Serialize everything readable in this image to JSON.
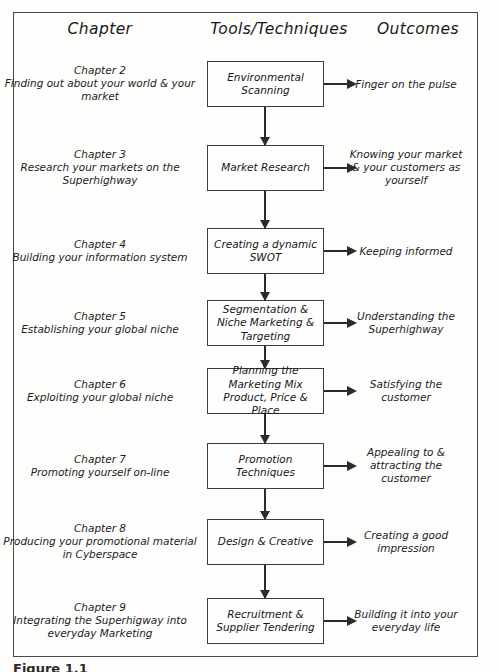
{
  "figure": {
    "caption": "Figure 1.1",
    "headers": {
      "chapter": "Chapter",
      "tools": "Tools/Techniques",
      "outcomes": "Outcomes"
    },
    "colors": {
      "page_background": "#fdfdfc",
      "frame_border": "#4a4a4a",
      "box_border": "#3d3d3d",
      "arrow": "#2b2b2b",
      "text": "#1a1a1a"
    },
    "rows": [
      {
        "chapter_title": "Chapter 2",
        "chapter_desc": "Finding out about your world & your market",
        "tool": "Environmental Scanning",
        "outcome": "Finger on the pulse"
      },
      {
        "chapter_title": "Chapter 3",
        "chapter_desc": "Research your markets on the Superhighway",
        "tool": "Market Research",
        "outcome": "Knowing your market & your customers as yourself"
      },
      {
        "chapter_title": "Chapter 4",
        "chapter_desc": "Building your information system",
        "tool": "Creating a dynamic SWOT",
        "outcome": "Keeping informed"
      },
      {
        "chapter_title": "Chapter 5",
        "chapter_desc": "Establishing your global niche",
        "tool": "Segmentation & Niche Marketing & Targeting",
        "outcome": "Understanding the Superhighway"
      },
      {
        "chapter_title": "Chapter 6",
        "chapter_desc": "Exploiting your global niche",
        "tool": "Planning the Marketing Mix Product, Price & Place",
        "outcome": "Satisfying the customer"
      },
      {
        "chapter_title": "Chapter 7",
        "chapter_desc": "Promoting yourself on-line",
        "tool": "Promotion Techniques",
        "outcome": "Appealing to & attracting the customer"
      },
      {
        "chapter_title": "Chapter 8",
        "chapter_desc": "Producing your promotional material in Cyberspace",
        "tool": "Design & Creative",
        "outcome": "Creating a good impression"
      },
      {
        "chapter_title": "Chapter 9",
        "chapter_desc": "Integrating the Superhigway into everyday Marketing",
        "tool": "Recruitment & Supplier Tendering",
        "outcome": "Building it into your everyday life"
      }
    ]
  }
}
